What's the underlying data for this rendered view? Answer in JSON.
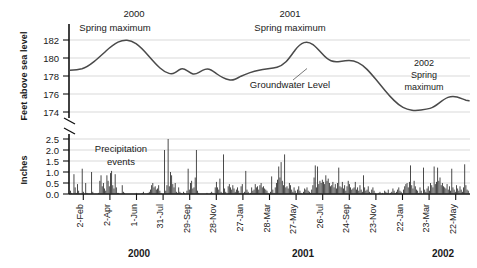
{
  "chart_data": {
    "type": "line",
    "title": "",
    "subtitle": "",
    "panels": [
      {
        "id": "groundwater",
        "type": "line",
        "ylabel": "Feet above sea level",
        "ylim": [
          173,
          183
        ],
        "yticks": [
          174,
          176,
          178,
          180,
          182
        ],
        "ytick_labels": [
          "174",
          "176",
          "178",
          "180",
          "182"
        ],
        "grid": true,
        "series": [
          {
            "name": "Groundwater Level",
            "x": [
              0,
              1,
              2,
              3,
              4,
              5,
              6,
              7,
              8,
              9,
              10,
              11,
              12,
              13,
              14,
              15,
              16,
              17,
              18,
              19,
              20,
              21,
              22,
              23,
              24,
              25,
              26,
              27,
              28,
              29,
              30,
              31,
              32,
              33,
              34,
              35,
              36,
              37,
              38,
              39,
              40,
              41,
              42,
              43,
              44,
              45,
              46,
              47,
              48,
              49,
              50,
              51,
              52,
              53,
              54,
              55,
              56,
              57,
              58,
              59,
              60,
              61,
              62,
              63,
              64,
              65,
              66,
              67,
              68,
              69,
              70,
              71,
              72,
              73,
              74,
              75,
              76,
              77,
              78,
              79,
              80
            ],
            "values": [
              178.7,
              178.7,
              178.75,
              178.9,
              179.2,
              179.6,
              180.0,
              180.4,
              180.8,
              181.2,
              181.5,
              181.8,
              182.0,
              182.1,
              182.1,
              182.05,
              181.9,
              181.6,
              181.2,
              180.8,
              180.3,
              179.8,
              179.3,
              178.9,
              178.6,
              178.3,
              178.1,
              178.0,
              178.15,
              178.4,
              178.5,
              178.35,
              178.15,
              178.1,
              178.25,
              178.5,
              178.6,
              178.5,
              178.3,
              178.1,
              177.85,
              177.6,
              177.45,
              177.4,
              177.5,
              177.7,
              177.9,
              178.1,
              178.3,
              178.5,
              178.7,
              178.85,
              179.0,
              179.1,
              179.2,
              179.35,
              179.6,
              180.2,
              181.0,
              181.6,
              181.85,
              181.8,
              181.5,
              181.1,
              180.7,
              180.4,
              180.25,
              180.2,
              180.3,
              180.35,
              180.2,
              179.9,
              179.4,
              178.9,
              178.4,
              177.9,
              177.3,
              176.7,
              176.2,
              175.7,
              175.2
            ],
            "values_tail": [
              174.8,
              174.5,
              174.35,
              174.3,
              174.35,
              174.4,
              174.6,
              175.0,
              175.4,
              175.65,
              175.75,
              175.6,
              175.45
            ],
            "max_2000": 182.1,
            "max_2001": 181.85,
            "max_2002": 175.75,
            "min_value": 174.3,
            "start_value": 178.7,
            "end_value": 175.45
          }
        ],
        "annotations": [
          {
            "id": "spring-max-2000",
            "line1": "2000",
            "line2": "Spring maximum"
          },
          {
            "id": "spring-max-2001",
            "line1": "2001",
            "line2": "Spring maximum"
          },
          {
            "id": "spring-max-2002",
            "line1": "2002",
            "line2": "Spring",
            "line3": "maximum"
          },
          {
            "id": "series-label",
            "text": "Groundwater Level"
          }
        ]
      },
      {
        "id": "precipitation",
        "type": "bar",
        "ylabel": "Inches",
        "ylim": [
          0.0,
          2.7
        ],
        "yticks": [
          0.0,
          0.5,
          1.0,
          1.5,
          2.0,
          2.5
        ],
        "ytick_labels": [
          "0.0",
          "0.5",
          "1.0",
          "1.5",
          "2.0",
          "2.5"
        ],
        "grid": true,
        "annotations": [
          {
            "id": "precip-label",
            "line1": "Precipitation",
            "line2": "events"
          }
        ],
        "series": [
          {
            "name": "Precipitation events",
            "max_value": 2.5,
            "values": [
              0.15,
              0.05,
              0.0,
              0.9,
              0.3,
              0.05,
              0.45,
              0.15,
              0.0,
              0.0,
              1.15,
              0.1,
              0.0,
              0.5,
              0.05,
              0.0,
              0.0,
              0.0,
              1.0,
              0.1,
              0.0,
              0.0,
              0.0,
              0.0,
              0.05,
              0.6,
              0.85,
              0.35,
              0.5,
              0.25,
              0.15,
              0.85,
              0.6,
              0.35,
              0.95,
              1.05,
              0.4,
              0.25,
              0.9,
              0.3,
              0.05,
              0.05,
              0.0,
              0.0,
              0.4,
              0.1,
              0.05,
              0.0,
              0.0,
              0.0,
              0.0,
              0.0,
              0.0,
              0.0,
              0.0,
              0.0,
              0.05,
              0.0,
              0.0,
              0.0,
              0.0,
              0.05,
              0.1,
              0.0,
              0.0,
              0.0,
              0.05,
              0.1,
              0.2,
              0.4,
              0.5,
              0.3,
              0.35,
              0.2,
              0.25,
              0.4,
              0.15,
              0.05,
              0.0,
              0.0,
              2.0,
              0.15,
              0.4,
              2.5,
              0.35,
              1.0,
              0.85,
              0.45,
              0.3,
              0.5,
              0.1,
              0.05,
              0.3,
              0.1,
              0.05,
              0.0,
              0.1,
              0.05,
              0.0,
              0.15,
              1.15,
              0.2,
              0.5,
              0.6,
              0.25,
              0.3,
              0.75,
              2.0,
              0.15,
              0.05,
              0.0,
              0.0,
              0.0,
              0.0,
              0.0,
              0.0,
              0.05,
              0.0,
              0.0,
              0.05,
              0.1,
              0.05,
              0.0,
              0.3,
              0.55,
              0.3,
              0.2,
              0.7,
              0.1,
              0.05,
              1.8,
              0.25,
              0.1,
              0.0,
              0.35,
              0.45,
              0.3,
              0.2,
              0.4,
              0.25,
              0.1,
              0.2,
              0.3,
              0.15,
              0.05,
              0.35,
              0.45,
              0.05,
              0.1,
              1.05,
              0.2,
              0.1,
              0.0,
              0.05,
              0.3,
              0.15,
              0.2,
              0.45,
              0.3,
              0.35,
              0.2,
              0.4,
              0.5,
              0.3,
              0.35,
              0.25,
              0.2,
              0.15,
              0.05,
              0.0,
              0.1,
              0.8,
              0.2,
              0.05,
              0.3,
              0.5,
              0.65,
              1.25,
              0.75,
              1.45,
              0.6,
              0.4,
              1.8,
              0.3,
              0.35,
              0.25,
              0.5,
              0.4,
              0.2,
              0.1,
              0.3,
              0.15,
              0.05,
              0.2,
              0.35,
              0.15,
              0.05,
              0.0,
              0.1,
              0.25,
              0.2,
              0.3,
              0.15,
              0.1,
              0.05,
              0.2,
              0.4,
              0.75,
              1.3,
              0.3,
              1.25,
              0.45,
              0.6,
              0.5,
              0.65,
              0.55,
              0.45,
              0.85,
              0.6,
              0.7,
              0.5,
              0.35,
              0.4,
              0.55,
              0.3,
              0.45,
              0.25,
              0.5,
              1.2,
              0.35,
              0.3,
              0.55,
              0.25,
              0.4,
              0.15,
              0.35,
              0.6,
              0.45,
              0.3,
              0.2,
              0.25,
              0.3,
              0.55,
              0.2,
              0.3,
              0.15,
              0.4,
              0.2,
              0.1,
              0.85,
              0.3,
              0.15,
              0.2,
              0.35,
              0.1,
              0.05,
              0.2,
              0.3,
              0.15,
              0.05,
              0.0,
              0.0,
              0.05,
              0.1,
              0.0,
              0.05,
              0.0,
              0.15,
              0.1,
              0.05,
              0.2,
              0.0,
              0.05,
              0.1,
              0.25,
              0.15,
              0.05,
              0.1,
              0.2,
              0.3,
              0.15,
              0.1,
              0.0,
              0.2,
              0.35,
              0.45,
              0.5,
              0.3,
              0.55,
              1.3,
              0.4,
              0.25,
              0.6,
              0.35,
              0.2,
              0.15,
              0.05,
              0.3,
              0.15,
              0.0,
              1.2,
              0.2,
              0.1,
              0.25,
              0.35,
              0.15,
              0.5,
              0.4,
              0.3,
              1.25,
              0.45,
              0.55,
              1.2,
              0.6,
              0.75,
              0.4,
              0.5,
              0.35,
              0.3,
              0.25,
              0.45,
              0.2,
              0.35,
              0.15,
              1.15,
              0.3,
              0.2,
              0.1,
              0.4,
              0.25,
              0.15,
              0.35,
              0.2,
              0.1,
              0.3,
              1.35,
              0.4,
              0.2,
              0.15
            ]
          }
        ]
      }
    ],
    "xlabel": "",
    "xticks": [
      "2-Feb",
      "2-Apr",
      "1-Jun",
      "31-Jul",
      "29-Sep",
      "28-Nov",
      "27-Jan",
      "28-Mar",
      "27-May",
      "26-Jul",
      "24-Sep",
      "23-Nov",
      "22-Jan",
      "23-Mar",
      "22-May"
    ],
    "year_labels": [
      {
        "label": "2000",
        "position": 0.175
      },
      {
        "label": "2001",
        "position": 0.585
      },
      {
        "label": "2002",
        "position": 0.935
      }
    ],
    "colors": {
      "curve": "#4a4a4a",
      "bar": "#2b2b2b",
      "grid": "#c8c8c8",
      "axis": "#111111",
      "background": "#ffffff"
    }
  },
  "upper": {
    "ylabel": "Feet above sea level",
    "yticks": [
      "182",
      "180",
      "178",
      "176",
      "174"
    ],
    "anno_2000_line1": "2000",
    "anno_2000_line2": "Spring maximum",
    "anno_2001_line1": "2001",
    "anno_2001_line2": "Spring maximum",
    "anno_2002_line1": "2002",
    "anno_2002_line2": "Spring",
    "anno_2002_line3": "maximum",
    "series_label": "Groundwater Level"
  },
  "lower": {
    "ylabel": "Inches",
    "yticks": [
      "2.5",
      "2.0",
      "1.5",
      "1.0",
      "0.5",
      "0.0"
    ],
    "anno_line1": "Precipitation",
    "anno_line2": "events"
  },
  "xaxis": {
    "ticks": [
      "2-Feb",
      "2-Apr",
      "1-Jun",
      "31-Jul",
      "29-Sep",
      "28-Nov",
      "27-Jan",
      "28-Mar",
      "27-May",
      "26-Jul",
      "24-Sep",
      "23-Nov",
      "22-Jan",
      "23-Mar",
      "22-May"
    ],
    "year_2000": "2000",
    "year_2001": "2001",
    "year_2002": "2002"
  }
}
